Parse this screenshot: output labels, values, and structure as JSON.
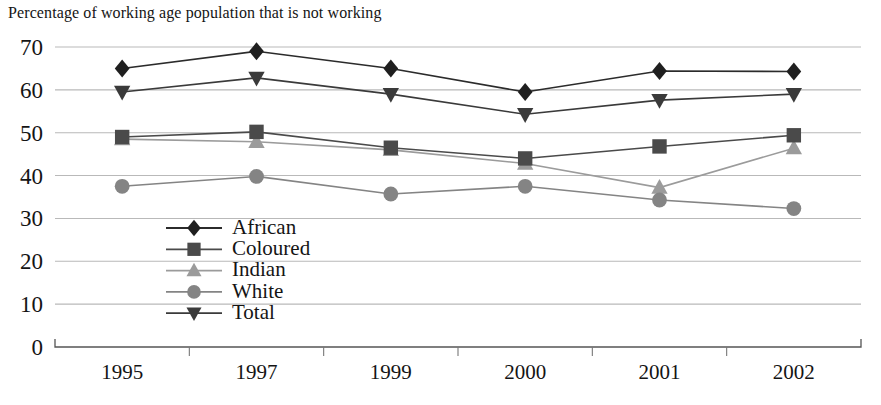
{
  "chart_data": {
    "type": "line",
    "title": "Percentage of working age population that is not working",
    "xlabel": "",
    "ylabel": "",
    "categories": [
      "1995",
      "1997",
      "1999",
      "2000",
      "2001",
      "2002"
    ],
    "ylim": [
      0,
      70
    ],
    "ytick_values": [
      0,
      10,
      20,
      30,
      40,
      50,
      60,
      70
    ],
    "ytick_labels": [
      "0",
      "10",
      "20",
      "30",
      "40",
      "50",
      "60",
      "70"
    ],
    "grid": true,
    "legend_position": "inside-lower-left",
    "series": [
      {
        "name": "African",
        "marker": "diamond",
        "color": "#1f1f1f",
        "line_color": "#2b2b2b",
        "values": [
          65.0,
          69.0,
          65.0,
          59.5,
          64.4,
          64.3
        ]
      },
      {
        "name": "Coloured",
        "marker": "square",
        "color": "#4a4a4a",
        "line_color": "#4a4a4a",
        "values": [
          49.0,
          50.2,
          46.5,
          44.0,
          46.8,
          49.4
        ]
      },
      {
        "name": "Indian",
        "marker": "triangle-up",
        "color": "#9b9b9b",
        "line_color": "#9b9b9b",
        "values": [
          48.5,
          47.9,
          46.0,
          42.8,
          37.2,
          46.4
        ]
      },
      {
        "name": "White",
        "marker": "circle",
        "color": "#848484",
        "line_color": "#848484",
        "values": [
          37.5,
          39.8,
          35.7,
          37.5,
          34.3,
          32.3
        ]
      },
      {
        "name": "Total",
        "marker": "triangle-down",
        "color": "#3a3a3a",
        "line_color": "#3a3a3a",
        "values": [
          59.5,
          62.8,
          59.0,
          54.3,
          57.6,
          59.0
        ]
      }
    ]
  },
  "legend": {
    "items": [
      {
        "label": "African"
      },
      {
        "label": "Coloured"
      },
      {
        "label": "Indian"
      },
      {
        "label": "White"
      },
      {
        "label": "Total"
      }
    ]
  },
  "colors": {
    "gridline": "#b9b9b9",
    "axis": "#555555",
    "text": "#141414",
    "background": "#ffffff"
  }
}
